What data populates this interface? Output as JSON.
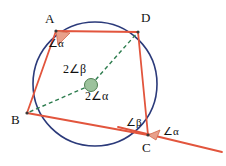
{
  "figure": {
    "kind": "circle-geometry-diagram",
    "width": 226,
    "height": 166,
    "background": "#ffffff"
  },
  "colors": {
    "circle_stroke": "#2b3a7a",
    "quadrilateral_stroke": "#e2553d",
    "tangent_stroke": "#e2553d",
    "radius_dashed_stroke": "#2e7d4f",
    "center_dot_fill": "#9cc29c",
    "center_dot_stroke": "#4f7f52",
    "angle_marker_fill": "#e8a08b",
    "angle_marker_stroke": "#d2674a",
    "text": "#111111"
  },
  "circle": {
    "name": "main-circle",
    "cx": 95,
    "cy": 84,
    "r": 62,
    "stroke_width": 1.6
  },
  "center": {
    "name": "circle-center",
    "cx": 91,
    "cy": 85,
    "dot_r": 6.5
  },
  "vertices": [
    {
      "id": "A",
      "label": "A",
      "x": 56,
      "y": 31,
      "label_x": 45,
      "label_y": 12
    },
    {
      "id": "D",
      "label": "D",
      "x": 138,
      "y": 32,
      "label_x": 141,
      "label_y": 11
    },
    {
      "id": "C",
      "label": "C",
      "x": 148,
      "y": 135,
      "label_x": 142,
      "label_y": 141
    },
    {
      "id": "B",
      "label": "B",
      "x": 27,
      "y": 113,
      "label_x": 11,
      "label_y": 113
    }
  ],
  "quadrilateral": {
    "name": "cyclic-quadrilateral-ABCD",
    "points": "56,31 138,32 148,135 27,113",
    "stroke_width": 1.8
  },
  "tangent_line": {
    "name": "tangent-at-C",
    "x1": 118,
    "y1": 127,
    "x2": 222,
    "y2": 152,
    "stroke_width": 1.8
  },
  "radii": [
    {
      "name": "radius-to-B",
      "x1": 91,
      "y1": 85,
      "x2": 27,
      "y2": 113
    },
    {
      "name": "radius-to-D",
      "x1": 91,
      "y1": 85,
      "x2": 138,
      "y2": 32
    }
  ],
  "angle_markers": [
    {
      "name": "angle-marker-at-A",
      "points": "56,31 70,33 58,45"
    },
    {
      "name": "angle-marker-at-C",
      "points": "148,135 160,130 156,140"
    }
  ],
  "angle_labels": [
    {
      "id": "alpha-at-A",
      "name": "angle-label-alpha-at-A",
      "text": "∠α",
      "x": 48,
      "y": 38,
      "cls": "angle-label"
    },
    {
      "id": "two-beta-at-center",
      "name": "angle-label-2beta-at-center",
      "text": "2∠β",
      "x": 63,
      "y": 63,
      "cls": "center-label"
    },
    {
      "id": "two-alpha-at-center",
      "name": "angle-label-2alpha-at-center",
      "text": "2∠α",
      "x": 85,
      "y": 90,
      "cls": "center-label"
    },
    {
      "id": "beta-at-C",
      "name": "angle-label-beta-at-C",
      "text": "∠β",
      "x": 126,
      "y": 117,
      "cls": "angle-label"
    },
    {
      "id": "alpha-at-C",
      "name": "angle-label-alpha-at-C",
      "text": "∠α",
      "x": 163,
      "y": 126,
      "cls": "angle-label"
    }
  ]
}
